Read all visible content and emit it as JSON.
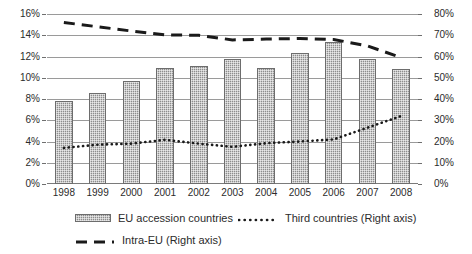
{
  "chart_data": {
    "type": "bar",
    "title": "",
    "subtitle": "",
    "xlabel": "",
    "ylabel": "",
    "categories": [
      "1998",
      "1999",
      "2000",
      "2001",
      "2002",
      "2003",
      "2004",
      "2005",
      "2006",
      "2007",
      "2008"
    ],
    "left_axis": {
      "label": "",
      "ylim": [
        0,
        16
      ],
      "tick_step": 2,
      "ticks": [
        "0%",
        "2%",
        "4%",
        "6%",
        "8%",
        "10%",
        "12%",
        "14%",
        "16%"
      ],
      "tick_values": [
        0,
        2,
        4,
        6,
        8,
        10,
        12,
        14,
        16
      ]
    },
    "right_axis": {
      "label": "",
      "ylim": [
        0,
        80
      ],
      "tick_step": 10,
      "ticks": [
        "0%",
        "10%",
        "20%",
        "30%",
        "40%",
        "50%",
        "60%",
        "70%",
        "80%"
      ],
      "tick_values": [
        0,
        10,
        20,
        30,
        40,
        50,
        60,
        70,
        80
      ]
    },
    "grid": true,
    "legend_position": "bottom",
    "series": [
      {
        "name": "EU accession countries",
        "legend_label": "EU accession countries",
        "type": "bar",
        "axis": "left",
        "marker": "bar-swatch",
        "values": [
          7.8,
          8.6,
          9.7,
          10.9,
          11.1,
          11.8,
          10.9,
          12.3,
          13.4,
          11.8,
          10.8
        ]
      },
      {
        "name": "Third countries",
        "legend_label": "Third countries (Right axis)",
        "type": "line",
        "axis": "right",
        "marker": "dotted",
        "values": [
          17.0,
          18.5,
          19.0,
          20.8,
          19.0,
          17.5,
          19.2,
          20.0,
          21.0,
          26.5,
          32.0
        ]
      },
      {
        "name": "Intra-EU",
        "legend_label": "Intra-EU (Right axis)",
        "type": "line",
        "axis": "right",
        "marker": "dashed",
        "values": [
          76.0,
          74.0,
          72.0,
          70.2,
          70.0,
          67.8,
          68.2,
          68.5,
          68.0,
          65.0,
          59.5
        ]
      }
    ]
  },
  "colors": {
    "bar_fill": "#8d8d8d",
    "bar_edge": "#6d6d6d",
    "gridline": "#9a9a9a",
    "line_dark": "#1a1a1a",
    "text": "#2b2b2b",
    "background": "#ffffff"
  }
}
